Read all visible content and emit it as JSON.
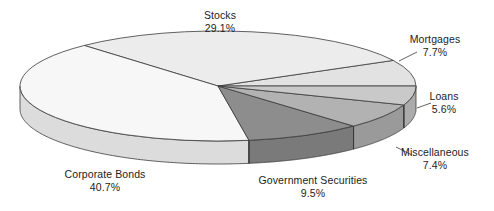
{
  "chart_data": {
    "type": "pie",
    "title": "",
    "subtitle": "",
    "xlabel": "",
    "ylabel": "",
    "legend_position": "none",
    "grid": false,
    "three_d": true,
    "unit": "%",
    "categories": [
      "Stocks",
      "Mortgages",
      "Loans",
      "Miscellaneous",
      "Government Securities",
      "Corporate Bonds"
    ],
    "values": [
      29.1,
      7.7,
      5.6,
      7.4,
      9.5,
      40.7
    ],
    "slices": [
      {
        "label": "Stocks",
        "percent": 29.1,
        "percent_text": "29.1%",
        "color": "#ececec",
        "side_color": "#d2d2d2"
      },
      {
        "label": "Mortgages",
        "percent": 7.7,
        "percent_text": "7.7%",
        "color": "#e2e2e2",
        "side_color": "#c6c6c6"
      },
      {
        "label": "Loans",
        "percent": 5.6,
        "percent_text": "5.6%",
        "color": "#c9c9c9",
        "side_color": "#ababab"
      },
      {
        "label": "Miscellaneous",
        "percent": 7.4,
        "percent_text": "7.4%",
        "color": "#b2b2b2",
        "side_color": "#9a9a9a"
      },
      {
        "label": "Government Securities",
        "percent": 9.5,
        "percent_text": "9.5%",
        "color": "#8d8d8d",
        "side_color": "#7a7a7a"
      },
      {
        "label": "Corporate Bonds",
        "percent": 40.7,
        "percent_text": "40.7%",
        "color": "#f7f7f7",
        "side_color": "#dcdcdc"
      }
    ]
  },
  "labels": {
    "stocks": {
      "name": "Stocks",
      "pct": "29.1%"
    },
    "mortgages": {
      "name": "Mortgages",
      "pct": "7.7%"
    },
    "loans": {
      "name": "Loans",
      "pct": "5.6%"
    },
    "misc": {
      "name": "Miscellaneous",
      "pct": "7.4%"
    },
    "corp_bonds": {
      "name": "Corporate Bonds",
      "pct": "40.7%"
    },
    "gov_sec": {
      "name": "Government Securities",
      "pct": "9.5%"
    }
  },
  "style": {
    "background": "#ffffff",
    "outline": "#3a3a3a",
    "text": "#1c1c1c"
  }
}
